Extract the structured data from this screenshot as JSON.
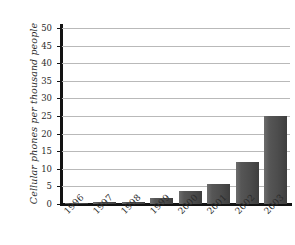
{
  "chart_data": {
    "type": "bar",
    "title": "",
    "subtitle": "",
    "xlabel": "",
    "ylabel": "Cellular phones per thousand people",
    "categories": [
      "1996",
      "1997",
      "1998",
      "1999",
      "2000",
      "2001",
      "2002",
      "2003"
    ],
    "values": [
      0.1,
      0.7,
      0.7,
      1.7,
      3.7,
      5.7,
      11.8,
      25.0
    ],
    "ylim": [
      0,
      50
    ],
    "ytick_values": [
      0,
      5,
      10,
      15,
      20,
      25,
      30,
      35,
      40,
      45,
      50
    ],
    "ytick_labels": [
      "0",
      "5",
      "10",
      "15",
      "20",
      "25",
      "30",
      "35",
      "40",
      "45",
      "50"
    ],
    "grid": true,
    "grid_axis": "y",
    "legend": false,
    "legend_position": "none",
    "bar_color": "#4d4d4d",
    "grid_color": "#b9b9b9",
    "axis_color": "#131313",
    "background_color": "#ffffff",
    "xtick_rotation": -45
  }
}
